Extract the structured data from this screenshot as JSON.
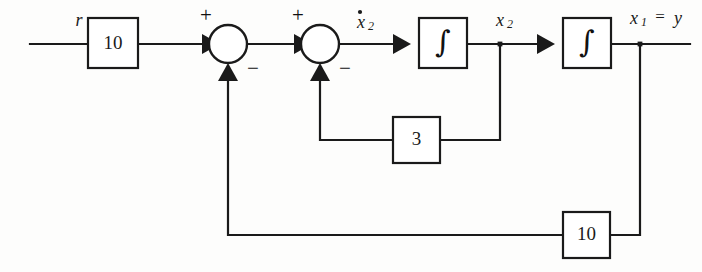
{
  "figure": {
    "kind": "control-system-block-diagram",
    "background_color": "#fdfdfc",
    "line_color": "#1a1a1a"
  },
  "signals": {
    "input_label": "r",
    "state_derivative_label": "x",
    "state_derivative_sub": "2",
    "state2_label": "x",
    "state2_sub": "2",
    "output_label": "x",
    "output_sub": "1",
    "output_equals": "=",
    "output_alias": "y"
  },
  "blocks": [
    {
      "id": "forward-gain",
      "name": "gain-block-forward",
      "label": "10",
      "x": 88,
      "y": 18,
      "w": 50,
      "h": 50
    },
    {
      "id": "integrator-1",
      "name": "integrator-block-first",
      "label": "∫",
      "x": 419,
      "y": 18,
      "w": 48,
      "h": 50
    },
    {
      "id": "integrator-2",
      "name": "integrator-block-second",
      "label": "∫",
      "x": 563,
      "y": 18,
      "w": 48,
      "h": 50
    },
    {
      "id": "inner-feedback-gain",
      "name": "gain-block-inner-feedback",
      "label": "3",
      "x": 393,
      "y": 117,
      "w": 47,
      "h": 46
    },
    {
      "id": "outer-feedback-gain",
      "name": "gain-block-outer-feedback",
      "label": "10",
      "x": 563,
      "y": 212,
      "w": 47,
      "h": 46
    }
  ],
  "summing_junctions": [
    {
      "id": "sum-outer",
      "name": "summing-junction-outer",
      "cx": 228,
      "cy": 44,
      "r": 19,
      "plus_sign": "+",
      "minus_sign": "−"
    },
    {
      "id": "sum-inner",
      "name": "summing-junction-inner",
      "cx": 320,
      "cy": 44,
      "r": 19,
      "plus_sign": "+",
      "minus_sign": "−"
    }
  ],
  "equations": {
    "described_system": "x1dot = x2 ; x2dot = 10(r - 10 x1) - 3 x2 ; y = x1"
  }
}
